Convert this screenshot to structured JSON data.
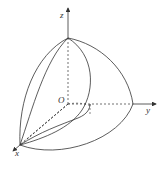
{
  "diagram": {
    "type": "3d-solid-sketch",
    "axes": {
      "x_label": "x",
      "y_label": "y",
      "z_label": "z",
      "origin_label": "O"
    },
    "colors": {
      "stroke": "#333333",
      "background": "#ffffff"
    }
  }
}
